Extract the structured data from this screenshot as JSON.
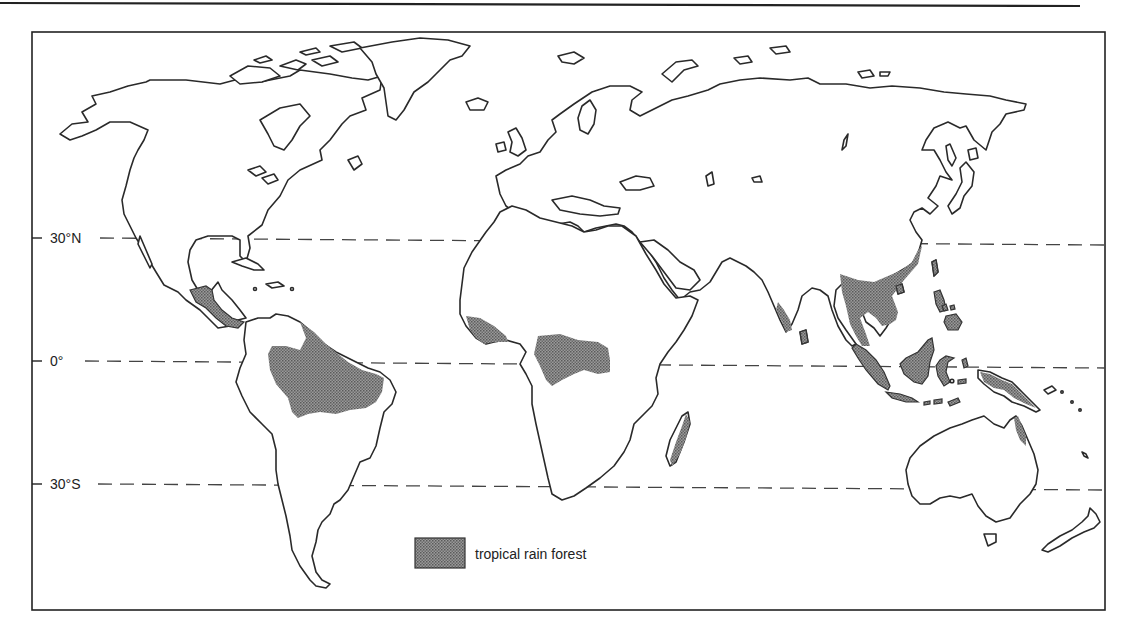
{
  "figure": {
    "title": ""
  },
  "latitude_lines": [
    {
      "label": "30°N",
      "y": 238
    },
    {
      "label": "0°",
      "y": 361
    },
    {
      "label": "30°S",
      "y": 484
    }
  ],
  "legend": {
    "label": "tropical rain forest",
    "swatch": "stippled-grey"
  },
  "rain_forest_regions": [
    "Central America",
    "Amazon Basin (South America)",
    "West Africa coast",
    "Congo Basin (Central Africa)",
    "Madagascar east coast",
    "Western Ghats (India)",
    "Sri Lanka",
    "Southeast Asia (Indochina, southern China)",
    "Malay Peninsula",
    "Sumatra",
    "Borneo",
    "Java",
    "Sulawesi",
    "Philippines",
    "New Guinea",
    "Queensland (NE Australia)"
  ],
  "colors": {
    "land_fill": "#ffffff",
    "outline": "#2a2a2a",
    "forest_fill": "#8c8c8c",
    "background": "#ffffff"
  }
}
